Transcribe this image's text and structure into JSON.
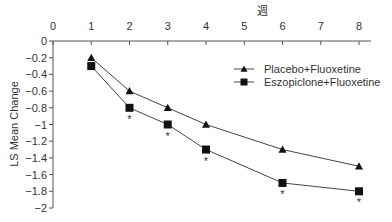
{
  "chart_data": {
    "type": "line",
    "title": "",
    "xlabel": "週",
    "ylabel": "LS Mean Change",
    "x_ticks": [
      0,
      1,
      2,
      3,
      4,
      5,
      6,
      7,
      8
    ],
    "x_tick_labels": [
      "0",
      "1",
      "2",
      "3",
      "4",
      "5",
      "6",
      "7",
      "8"
    ],
    "y_ticks": [
      0,
      -0.2,
      -0.4,
      -0.6,
      -0.8,
      -1,
      -1.2,
      -1.4,
      -1.6,
      -1.8,
      -2
    ],
    "y_tick_labels": [
      "0",
      "-0.2",
      "-0.4",
      "-0.6",
      "-0.8",
      "-1",
      "-1.2",
      "-1.4",
      "-1.6",
      "-1.8",
      "-2"
    ],
    "xlim": [
      0,
      8
    ],
    "ylim": [
      -2,
      0
    ],
    "x_axis_position": "top",
    "grid": false,
    "legend_position": "upper-right",
    "x": [
      1,
      2,
      3,
      4,
      6,
      8
    ],
    "series": [
      {
        "name": "Placebo+Fluoxetine",
        "marker": "triangle",
        "values": [
          -0.2,
          -0.6,
          -0.8,
          -1.0,
          -1.3,
          -1.5
        ]
      },
      {
        "name": "Eszopiclone+Fluoxetine",
        "marker": "square",
        "values": [
          -0.3,
          -0.8,
          -1.0,
          -1.3,
          -1.7,
          -1.8
        ]
      }
    ],
    "annotations": [
      {
        "text": "*",
        "x": 2,
        "series": "Eszopiclone+Fluoxetine",
        "meaning": "significance marker"
      },
      {
        "text": "*",
        "x": 3,
        "series": "Eszopiclone+Fluoxetine",
        "meaning": "significance marker"
      },
      {
        "text": "*",
        "x": 4,
        "series": "Eszopiclone+Fluoxetine",
        "meaning": "significance marker"
      },
      {
        "text": "*",
        "x": 6,
        "series": "Eszopiclone+Fluoxetine",
        "meaning": "significance marker"
      },
      {
        "text": "*",
        "x": 8,
        "series": "Eszopiclone+Fluoxetine",
        "meaning": "significance marker"
      }
    ]
  },
  "colors": {
    "line": "#444444",
    "marker": "#111111",
    "axis": "#555555",
    "text": "#333333"
  }
}
